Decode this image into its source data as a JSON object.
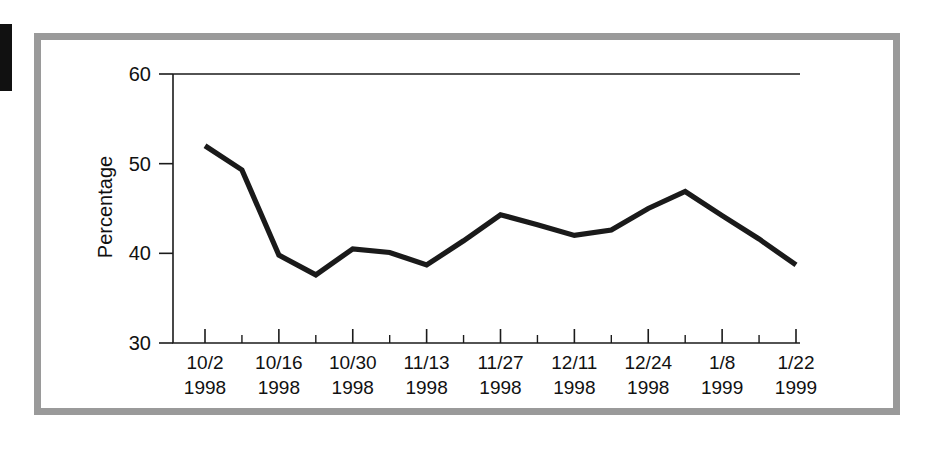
{
  "figure": {
    "frame_color": "#9a9a9a",
    "background_color": "#ffffff",
    "line_color": "#1a1a1a",
    "left_tab_color": "#111111"
  },
  "chart_data": {
    "type": "line",
    "title": "",
    "xlabel": "",
    "ylabel": "Percentage",
    "ylim": [
      30,
      60
    ],
    "ytick_labels": [
      "60",
      "50",
      "40",
      "30"
    ],
    "ytick_values": [
      60,
      50,
      40,
      30
    ],
    "grid": false,
    "legend": "none",
    "x_major_labels": [
      {
        "date": "10/2",
        "year": "1998"
      },
      {
        "date": "10/16",
        "year": "1998"
      },
      {
        "date": "10/30",
        "year": "1998"
      },
      {
        "date": "11/13",
        "year": "1998"
      },
      {
        "date": "11/27",
        "year": "1998"
      },
      {
        "date": "12/11",
        "year": "1998"
      },
      {
        "date": "12/24",
        "year": "1998"
      },
      {
        "date": "1/8",
        "year": "1999"
      },
      {
        "date": "1/22",
        "year": "1999"
      }
    ],
    "x": [
      "10/2/1998",
      "10/9/1998",
      "10/16/1998",
      "10/23/1998",
      "10/30/1998",
      "11/6/1998",
      "11/13/1998",
      "11/20/1998",
      "11/27/1998",
      "12/4/1998",
      "12/11/1998",
      "12/18/1998",
      "12/24/1998",
      "1/1/1999",
      "1/8/1999",
      "1/15/1999",
      "1/22/1999"
    ],
    "values": [
      52.0,
      49.3,
      39.8,
      37.6,
      40.5,
      40.1,
      38.7,
      41.4,
      44.3,
      43.2,
      42.0,
      42.6,
      45.0,
      46.9,
      44.2,
      41.6,
      38.7
    ],
    "series": [
      {
        "name": "Percentage",
        "values": [
          52.0,
          49.3,
          39.8,
          37.6,
          40.5,
          40.1,
          38.7,
          41.4,
          44.3,
          43.2,
          42.0,
          42.6,
          45.0,
          46.9,
          44.2,
          41.6,
          38.7
        ]
      }
    ]
  }
}
